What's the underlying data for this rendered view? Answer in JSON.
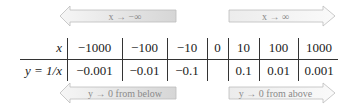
{
  "arrows": {
    "top_left": {
      "label": "x → −∞",
      "direction": "left"
    },
    "top_right": {
      "label": "x → ∞",
      "direction": "right"
    },
    "bottom_left": {
      "label": "y → 0 from below",
      "direction": "left"
    },
    "bottom_right": {
      "label": "y → 0 from above",
      "direction": "right"
    }
  },
  "table": {
    "row_labels": {
      "x": "x",
      "y": "y = 1/x"
    },
    "x_values": [
      "−1000",
      "−100",
      "−10",
      "0",
      "10",
      "100",
      "1000"
    ],
    "y_values": [
      "−0.001",
      "−0.01",
      "−0.1",
      "",
      "0.1",
      "0.01",
      "0.001"
    ]
  },
  "colors": {
    "arrow_fill_dark": "#d8d8d8",
    "arrow_fill_light": "#f4f4f4",
    "arrow_stroke": "#b8b8b8",
    "arrow_text": "#8a8a8a",
    "rule": "#333333"
  }
}
